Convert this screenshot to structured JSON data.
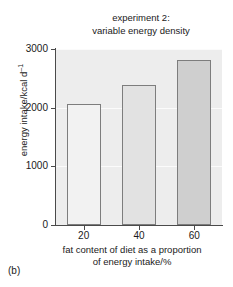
{
  "panel": {
    "label": "(b)"
  },
  "chart_data": {
    "type": "bar",
    "title": "experiment 2:\nvariable energy density",
    "title_line1": "experiment 2:",
    "title_line2": "variable energy density",
    "categories": [
      "20",
      "40",
      "60"
    ],
    "values": [
      2070,
      2390,
      2820
    ],
    "xlabel": "fat content of diet as a proportion\nof energy intake/%",
    "xlabel_line1": "fat content of diet as a proportion",
    "xlabel_line2": "of energy intake/%",
    "ylabel": "energy intake/kcal d",
    "ylabel_exponent": "–1",
    "ylim": [
      0,
      3000
    ],
    "yticks": [
      "0",
      "1000",
      "2000",
      "3000"
    ],
    "ytick_values": [
      0,
      1000,
      2000,
      3000
    ],
    "xticks": [
      "20",
      "40",
      "60"
    ],
    "grid": true,
    "legend": "none",
    "bar_colors": [
      "#f2f2f2",
      "#e2e2e2",
      "#cfcfcf"
    ],
    "bar_edge_color": "#7d7d7d",
    "plot_background": "#ededed",
    "gridline_color": "#fbfbfb",
    "axis_color": "#4a4a4a"
  }
}
